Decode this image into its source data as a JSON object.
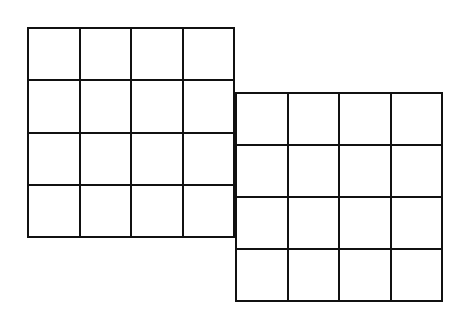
{
  "diagram": {
    "type": "overlapping-grids",
    "line_color": "#111111",
    "background": "#ffffff",
    "grids": [
      {
        "name": "left-grid",
        "rows": 4,
        "cols": 4,
        "x": 27,
        "y": 27,
        "width": 208,
        "height": 211
      },
      {
        "name": "right-grid",
        "rows": 4,
        "cols": 4,
        "x": 235,
        "y": 92,
        "width": 208,
        "height": 210
      }
    ]
  }
}
